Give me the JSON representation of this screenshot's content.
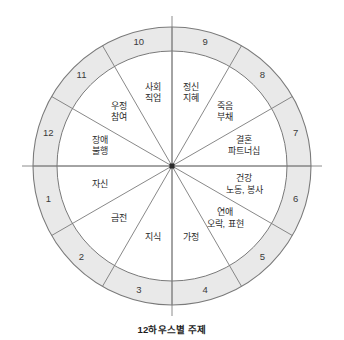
{
  "caption": "12하우스별 주제",
  "colors": {
    "ring_fill": "#e9e9e9",
    "inner_fill": "#ffffff",
    "stroke": "#7a7a7a",
    "axis": "#8c8c8c",
    "hub": "#2b2b2b",
    "text": "#2b2b2b"
  },
  "chart_data": {
    "type": "pie",
    "title": "12하우스별 주제",
    "legend": "none",
    "grid": false,
    "geometry": {
      "center_x": 172,
      "center_y": 166,
      "outer_radius": 139,
      "inner_radius": 115,
      "sector_count": 12,
      "sector_degrees": 30,
      "direction": "counterclockwise",
      "axes": [
        "vertical",
        "horizontal"
      ]
    },
    "categories": [
      "1",
      "2",
      "3",
      "4",
      "5",
      "6",
      "7",
      "8",
      "9",
      "10",
      "11",
      "12"
    ],
    "values": [
      30,
      30,
      30,
      30,
      30,
      30,
      30,
      30,
      30,
      30,
      30,
      30
    ],
    "xlabel": "",
    "ylabel": "",
    "houses": [
      {
        "number": "1",
        "theme_line1": "자신",
        "theme_line2": "",
        "num_angle_deg": 195,
        "theme_angle_deg": 195
      },
      {
        "number": "2",
        "theme_line1": "금전",
        "theme_line2": "",
        "num_angle_deg": 225,
        "theme_angle_deg": 225
      },
      {
        "number": "3",
        "theme_line1": "지식",
        "theme_line2": "",
        "num_angle_deg": 255,
        "theme_angle_deg": 255
      },
      {
        "number": "4",
        "theme_line1": "가정",
        "theme_line2": "",
        "num_angle_deg": 285,
        "theme_angle_deg": 285
      },
      {
        "number": "5",
        "theme_line1": "연애",
        "theme_line2": "오락, 표현",
        "num_angle_deg": 315,
        "theme_angle_deg": 315
      },
      {
        "number": "6",
        "theme_line1": "건강",
        "theme_line2": "노동, 봉사",
        "num_angle_deg": 345,
        "theme_angle_deg": 345
      },
      {
        "number": "7",
        "theme_line1": "결혼",
        "theme_line2": "파트너십",
        "num_angle_deg": 15,
        "theme_angle_deg": 15
      },
      {
        "number": "8",
        "theme_line1": "죽음",
        "theme_line2": "부채",
        "num_angle_deg": 45,
        "theme_angle_deg": 45
      },
      {
        "number": "9",
        "theme_line1": "정신",
        "theme_line2": "지혜",
        "num_angle_deg": 75,
        "theme_angle_deg": 75
      },
      {
        "number": "10",
        "theme_line1": "사회",
        "theme_line2": "직업",
        "num_angle_deg": 105,
        "theme_angle_deg": 105
      },
      {
        "number": "11",
        "theme_line1": "우정",
        "theme_line2": "참여",
        "num_angle_deg": 135,
        "theme_angle_deg": 135
      },
      {
        "number": "12",
        "theme_line1": "장애",
        "theme_line2": "불행",
        "num_angle_deg": 165,
        "theme_angle_deg": 165
      }
    ]
  }
}
